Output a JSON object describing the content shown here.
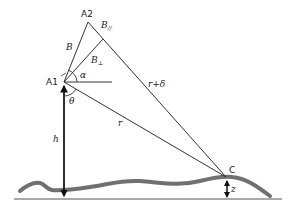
{
  "diagram": {
    "points": {
      "A1": "A1",
      "A2": "A2",
      "C": "C"
    },
    "labels": {
      "B": "B",
      "B_parallel": "B",
      "B_parallel_sub": "//",
      "B_perp": "B",
      "B_perp_sub": "⊥",
      "alpha": "α",
      "theta": "θ",
      "h": "h",
      "r": "r",
      "r_plus_delta": "r+δ",
      "z": "z"
    },
    "colors": {
      "line": "#333333",
      "terrain": "#707070",
      "baseline": "#555555"
    }
  }
}
